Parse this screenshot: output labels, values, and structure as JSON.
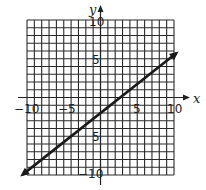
{
  "chart_data": {
    "type": "line",
    "title": "",
    "xlabel": "x",
    "ylabel": "y",
    "xlim": [
      -10,
      10
    ],
    "ylim": [
      -10,
      10
    ],
    "grid": true,
    "grid_step": 1,
    "x_tick_labels": [
      "-10",
      "-5",
      "5",
      "10"
    ],
    "y_tick_labels": [
      "10",
      "5",
      "-5",
      "-10"
    ],
    "series": [
      {
        "name": "line",
        "equation": "y = 0.75x - 2",
        "slope": 0.75,
        "intercept": -2,
        "x": [
          -10.6,
          10.3
        ],
        "y": [
          -9.95,
          5.7
        ],
        "arrows": "both"
      }
    ]
  },
  "labels": {
    "x_axis": "x",
    "y_axis": "y",
    "x_neg10": "−10",
    "x_neg5": "−5",
    "x_pos5": "5",
    "x_pos10": "10",
    "y_pos10": "10",
    "y_pos5": "5",
    "y_neg5": "5",
    "y_neg10": "−10"
  },
  "colors": {
    "grid": "#2a2a2a",
    "line": "#1a1a1a",
    "background": "#ffffff"
  }
}
